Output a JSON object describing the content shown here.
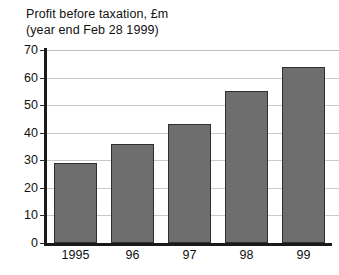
{
  "chart_data": {
    "type": "bar",
    "title": "Profit before taxation, £m",
    "subtitle": "(year end Feb 28 1999)",
    "xlabel": "",
    "ylabel": "",
    "categories": [
      "1995",
      "96",
      "97",
      "98",
      "99"
    ],
    "values": [
      29,
      36,
      43,
      55,
      64
    ],
    "ylim": [
      0,
      70
    ],
    "yticks": [
      0,
      10,
      20,
      30,
      40,
      50,
      60,
      70
    ],
    "ytick_labels": [
      "0",
      "10",
      "20",
      "30",
      "40",
      "50",
      "60",
      "70"
    ],
    "grid": true,
    "legend": false,
    "series": [
      {
        "name": "Profit before taxation",
        "values": [
          29,
          36,
          43,
          55,
          64
        ]
      }
    ],
    "colors": {
      "bar_fill": "#6e6e6e",
      "bar_border": "#2f2f2f",
      "gridline": "#c9c9c9",
      "axis": "#1a1a1a",
      "background": "#ffffff",
      "text": "#111111"
    }
  }
}
